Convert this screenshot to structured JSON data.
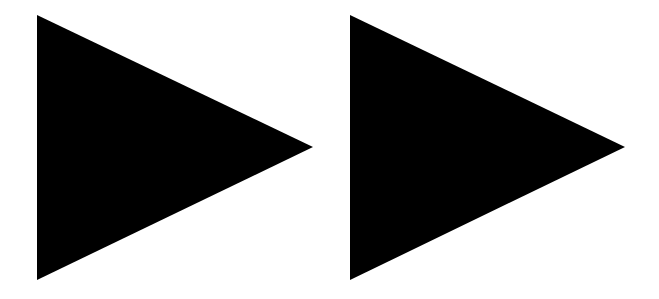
{
  "icon": {
    "name": "fast-forward",
    "label": "Fast forward",
    "color": "#000000",
    "background": "#ffffff",
    "triangles": [
      {
        "points": "37,15 313,147 37,280"
      },
      {
        "points": "350,15 625,147 350,280"
      }
    ]
  }
}
